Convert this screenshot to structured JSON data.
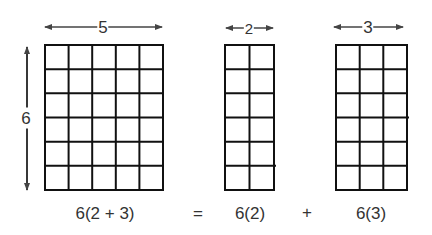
{
  "diagram": {
    "grids": [
      {
        "name": "full",
        "cols": 5,
        "rows": 6,
        "width_label": "5"
      },
      {
        "name": "left-part",
        "cols": 2,
        "rows": 6,
        "width_label": "2"
      },
      {
        "name": "right-part",
        "cols": 3,
        "rows": 6,
        "width_label": "3"
      }
    ],
    "height_label": "6",
    "equation": {
      "lhs": "6(2 + 3)",
      "equals": "=",
      "term1": "6(2)",
      "plus": "+",
      "term2": "6(3)"
    }
  }
}
